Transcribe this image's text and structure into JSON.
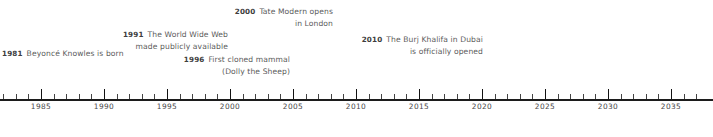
{
  "figure": {
    "type": "timeline",
    "title": "",
    "axis": {
      "orientation": "horizontal",
      "start_year": 1981,
      "end_year": 2037,
      "pixels_per_year": 12.6,
      "origin_year": 1985,
      "origin_x": 41,
      "minor_tick_step": 1,
      "major_tick_step": 5,
      "tick_labels": [
        "1985",
        "1990",
        "1995",
        "2000",
        "2005",
        "2010",
        "2015",
        "2020",
        "2025",
        "2030",
        "2035"
      ],
      "tick_label_years": [
        1985,
        1990,
        1995,
        2000,
        2005,
        2010,
        2015,
        2020,
        2025,
        2030,
        2035
      ],
      "line_color": "#1c1c1c",
      "tick_color": "#2a2a2a",
      "label_color": "#4a4a4a"
    },
    "events": [
      {
        "year": "1981",
        "line1": "Beyoncé Knowles is born",
        "line2": "",
        "align": "left",
        "x": 2,
        "y": 45
      },
      {
        "year": "1991",
        "line1": "The World Wide Web",
        "line2": "made publicly available",
        "align": "right",
        "right": 485,
        "y": 26
      },
      {
        "year": "2000",
        "line1": "Tate Modern opens",
        "line2": "in London",
        "align": "right",
        "right": 380,
        "y": 3
      },
      {
        "year": "1996",
        "line1": "First cloned mammal",
        "line2": "(Dolly the Sheep)",
        "align": "right",
        "right": 423,
        "y": 51
      },
      {
        "year": "2010",
        "line1": "The Burj Khalifa in Dubai",
        "line2": "is officially opened",
        "align": "right",
        "right": 230,
        "y": 31
      }
    ],
    "colors": {
      "year_text": "#3d3d3d",
      "event_text": "#5b5b5b",
      "background": "#ffffff"
    }
  }
}
